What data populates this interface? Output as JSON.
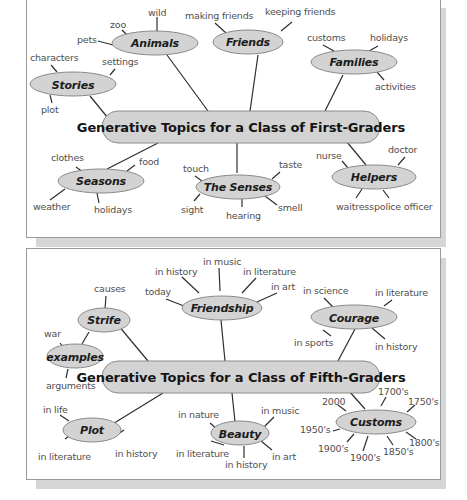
{
  "panels": [
    {
      "id": "first-graders",
      "central_topic": "Generative Topics for a Class of First-Graders",
      "topics": [
        {
          "label": "Animals",
          "subtopics": [
            "pets",
            "zoo",
            "wild"
          ]
        },
        {
          "label": "Friends",
          "subtopics": [
            "making friends",
            "keeping friends"
          ]
        },
        {
          "label": "Families",
          "subtopics": [
            "customs",
            "holidays",
            "activities"
          ]
        },
        {
          "label": "Stories",
          "subtopics": [
            "characters",
            "settings",
            "plot"
          ]
        },
        {
          "label": "Seasons",
          "subtopics": [
            "clothes",
            "food",
            "weather",
            "holidays"
          ]
        },
        {
          "label": "The Senses",
          "subtopics": [
            "touch",
            "taste",
            "sight",
            "hearing",
            "smell"
          ]
        },
        {
          "label": "Helpers",
          "subtopics": [
            "nurse",
            "doctor",
            "waitress",
            "police officer"
          ]
        }
      ]
    },
    {
      "id": "fifth-graders",
      "central_topic": "Generative Topics for a Class of Fifth-Graders",
      "topics": [
        {
          "label": "Strife",
          "subtopics": [
            "causes"
          ]
        },
        {
          "label": "examples",
          "subtopics": [
            "war",
            "arguments"
          ]
        },
        {
          "label": "Friendship",
          "subtopics": [
            "today",
            "in history",
            "in music",
            "in literature",
            "in art"
          ]
        },
        {
          "label": "Courage",
          "subtopics": [
            "in science",
            "in literature",
            "in sports",
            "in history"
          ]
        },
        {
          "label": "Plot",
          "subtopics": [
            "in life",
            "in literature",
            "in history"
          ]
        },
        {
          "label": "Beauty",
          "subtopics": [
            "in nature",
            "in music",
            "in literature",
            "in history",
            "in art"
          ]
        },
        {
          "label": "Customs",
          "subtopics": [
            "2000",
            "1700's",
            "1750's",
            "1950's",
            "1800's",
            "1900's",
            "1900's",
            "1850's"
          ]
        }
      ]
    }
  ],
  "colors": {
    "node_fill": "#d3d3d3",
    "node_border": "#8a8a8a",
    "line": "#2e2e2e",
    "leaf_text": "#4f4f4f",
    "panel_border": "#9a9a9a",
    "shadow": "#d6d6d6"
  }
}
